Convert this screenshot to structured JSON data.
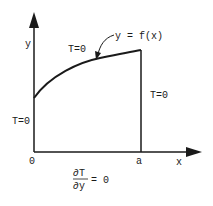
{
  "diagram": {
    "axes": {
      "y_label": "y",
      "x_label": "x",
      "origin_label": "0",
      "a_label": "a"
    },
    "curve_label": "y = f(x)",
    "boundary_conditions": {
      "top": "T=0",
      "right": "T=0",
      "left": "T=0",
      "bottom_numerator": "∂T",
      "bottom_denominator": "∂y",
      "bottom_rhs": "= 0"
    },
    "colors": {
      "line": "#1a1a1a",
      "background": "#ffffff"
    }
  }
}
